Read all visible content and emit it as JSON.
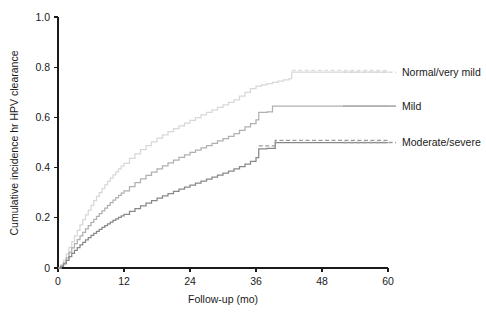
{
  "chart_data": {
    "type": "line",
    "title": "",
    "xlabel": "Follow-up (mo)",
    "ylabel": "Cumulative incidence hr HPV clearance",
    "xlim": [
      0,
      60
    ],
    "ylim": [
      0,
      1.0
    ],
    "grid": false,
    "legend_position": "right",
    "x_ticks": [
      0,
      12,
      24,
      36,
      48,
      60
    ],
    "x_tick_labels": [
      "0",
      "12",
      "24",
      "36",
      "48",
      "60"
    ],
    "y_ticks": [
      0,
      0.2,
      0.4,
      0.6,
      0.8,
      1.0
    ],
    "y_tick_labels": [
      "0",
      "0.2",
      "0.4",
      "0.6",
      "0.8",
      "1.0"
    ],
    "series": [
      {
        "name": "Normal/very mild",
        "color": "#d8d8d8",
        "style": "solid",
        "label_y": 0.78,
        "points": [
          [
            0,
            0
          ],
          [
            0.5,
            0.012
          ],
          [
            1,
            0.03
          ],
          [
            1.5,
            0.055
          ],
          [
            2,
            0.082
          ],
          [
            2.5,
            0.105
          ],
          [
            3,
            0.128
          ],
          [
            3.5,
            0.15
          ],
          [
            4,
            0.172
          ],
          [
            4.5,
            0.193
          ],
          [
            5,
            0.212
          ],
          [
            5.5,
            0.231
          ],
          [
            6,
            0.25
          ],
          [
            6.5,
            0.268
          ],
          [
            7,
            0.285
          ],
          [
            7.5,
            0.3
          ],
          [
            8,
            0.316
          ],
          [
            8.5,
            0.331
          ],
          [
            9,
            0.345
          ],
          [
            9.5,
            0.358
          ],
          [
            10,
            0.371
          ],
          [
            10.5,
            0.383
          ],
          [
            11,
            0.395
          ],
          [
            11.5,
            0.406
          ],
          [
            12,
            0.417
          ],
          [
            13,
            0.437
          ],
          [
            14,
            0.455
          ],
          [
            15,
            0.472
          ],
          [
            16,
            0.488
          ],
          [
            17,
            0.503
          ],
          [
            18,
            0.517
          ],
          [
            19,
            0.53
          ],
          [
            20,
            0.543
          ],
          [
            21,
            0.555
          ],
          [
            22,
            0.566
          ],
          [
            23,
            0.577
          ],
          [
            24,
            0.588
          ],
          [
            25,
            0.599
          ],
          [
            26,
            0.61
          ],
          [
            27,
            0.62
          ],
          [
            28,
            0.63
          ],
          [
            29,
            0.64
          ],
          [
            30,
            0.65
          ],
          [
            31,
            0.66
          ],
          [
            32,
            0.67
          ],
          [
            33,
            0.685
          ],
          [
            34,
            0.7
          ],
          [
            35,
            0.715
          ],
          [
            36,
            0.725
          ],
          [
            37,
            0.73
          ],
          [
            38,
            0.735
          ],
          [
            39,
            0.74
          ],
          [
            40,
            0.745
          ],
          [
            41,
            0.75
          ],
          [
            42,
            0.755
          ],
          [
            42.5,
            0.78
          ],
          [
            60,
            0.78
          ]
        ]
      },
      {
        "name": "Mild",
        "color": "#b0b0b0",
        "style": "solid",
        "label_y": 0.645,
        "points": [
          [
            0,
            0
          ],
          [
            0.5,
            0.008
          ],
          [
            1,
            0.02
          ],
          [
            1.5,
            0.04
          ],
          [
            2,
            0.062
          ],
          [
            2.5,
            0.08
          ],
          [
            3,
            0.097
          ],
          [
            3.5,
            0.113
          ],
          [
            4,
            0.128
          ],
          [
            4.5,
            0.142
          ],
          [
            5,
            0.156
          ],
          [
            5.5,
            0.169
          ],
          [
            6,
            0.182
          ],
          [
            6.5,
            0.194
          ],
          [
            7,
            0.206
          ],
          [
            7.5,
            0.217
          ],
          [
            8,
            0.228
          ],
          [
            8.5,
            0.239
          ],
          [
            9,
            0.25
          ],
          [
            9.5,
            0.26
          ],
          [
            10,
            0.27
          ],
          [
            10.5,
            0.28
          ],
          [
            11,
            0.289
          ],
          [
            11.5,
            0.298
          ],
          [
            12,
            0.307
          ],
          [
            13,
            0.324
          ],
          [
            14,
            0.34
          ],
          [
            15,
            0.355
          ],
          [
            16,
            0.369
          ],
          [
            17,
            0.382
          ],
          [
            18,
            0.395
          ],
          [
            19,
            0.407
          ],
          [
            20,
            0.419
          ],
          [
            21,
            0.43
          ],
          [
            22,
            0.441
          ],
          [
            23,
            0.451
          ],
          [
            24,
            0.461
          ],
          [
            25,
            0.47
          ],
          [
            26,
            0.479
          ],
          [
            27,
            0.488
          ],
          [
            28,
            0.497
          ],
          [
            29,
            0.506
          ],
          [
            30,
            0.515
          ],
          [
            31,
            0.524
          ],
          [
            32,
            0.535
          ],
          [
            33,
            0.548
          ],
          [
            34,
            0.562
          ],
          [
            35,
            0.575
          ],
          [
            36,
            0.59
          ],
          [
            36.5,
            0.62
          ],
          [
            37,
            0.62
          ],
          [
            38,
            0.622
          ],
          [
            39,
            0.645
          ],
          [
            39.5,
            0.645
          ],
          [
            60,
            0.645
          ]
        ]
      },
      {
        "name": "Moderate/severe",
        "color": "#888888",
        "style": "solid",
        "label_y": 0.5,
        "points": [
          [
            0,
            0
          ],
          [
            0.5,
            0.006
          ],
          [
            1,
            0.016
          ],
          [
            1.5,
            0.03
          ],
          [
            2,
            0.045
          ],
          [
            2.5,
            0.058
          ],
          [
            3,
            0.07
          ],
          [
            3.5,
            0.081
          ],
          [
            4,
            0.092
          ],
          [
            4.5,
            0.102
          ],
          [
            5,
            0.112
          ],
          [
            5.5,
            0.121
          ],
          [
            6,
            0.13
          ],
          [
            6.5,
            0.138
          ],
          [
            7,
            0.146
          ],
          [
            7.5,
            0.154
          ],
          [
            8,
            0.162
          ],
          [
            8.5,
            0.169
          ],
          [
            9,
            0.176
          ],
          [
            9.5,
            0.183
          ],
          [
            10,
            0.19
          ],
          [
            10.5,
            0.196
          ],
          [
            11,
            0.202
          ],
          [
            11.5,
            0.208
          ],
          [
            12,
            0.214
          ],
          [
            13,
            0.226
          ],
          [
            14,
            0.237
          ],
          [
            15,
            0.248
          ],
          [
            16,
            0.258
          ],
          [
            17,
            0.268
          ],
          [
            18,
            0.278
          ],
          [
            19,
            0.287
          ],
          [
            20,
            0.296
          ],
          [
            21,
            0.305
          ],
          [
            22,
            0.314
          ],
          [
            23,
            0.322
          ],
          [
            24,
            0.33
          ],
          [
            25,
            0.338
          ],
          [
            26,
            0.346
          ],
          [
            27,
            0.354
          ],
          [
            28,
            0.362
          ],
          [
            29,
            0.37
          ],
          [
            30,
            0.378
          ],
          [
            31,
            0.386
          ],
          [
            32,
            0.395
          ],
          [
            33,
            0.404
          ],
          [
            34,
            0.414
          ],
          [
            35,
            0.425
          ],
          [
            36,
            0.44
          ],
          [
            36.5,
            0.475
          ],
          [
            37,
            0.475
          ],
          [
            38,
            0.477
          ],
          [
            39,
            0.477
          ],
          [
            39.5,
            0.5
          ],
          [
            60,
            0.5
          ]
        ]
      }
    ],
    "overlay_series": [
      {
        "name": "Moderate/severe-dashed-overlay",
        "color": "#9a9a9a",
        "style": "dashed",
        "points": [
          [
            36.5,
            0.487
          ],
          [
            39,
            0.487
          ],
          [
            39.5,
            0.508
          ],
          [
            60,
            0.508
          ]
        ]
      },
      {
        "name": "Normal/very-mild-dashed-overlay",
        "color": "#dddddd",
        "style": "dashed",
        "points": [
          [
            42.5,
            0.787
          ],
          [
            60,
            0.787
          ]
        ]
      }
    ]
  },
  "legend": {
    "entries": [
      {
        "label": "Normal/very mild",
        "color": "#d8d8d8",
        "style": "dashed"
      },
      {
        "label": "Mild",
        "color": "#b0b0b0",
        "style": "solid"
      },
      {
        "label": "Moderate/severe",
        "color": "#9a9a9a",
        "style": "dashed"
      }
    ]
  }
}
